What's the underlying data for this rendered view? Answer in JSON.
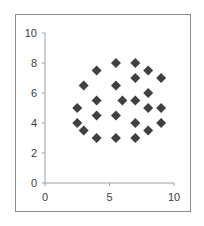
{
  "chart_data": {
    "type": "scatter",
    "title": "",
    "xlabel": "",
    "ylabel": "",
    "xlim": [
      0,
      10
    ],
    "ylim": [
      0,
      10
    ],
    "x_ticks": [
      0,
      5,
      10
    ],
    "y_ticks": [
      0,
      2,
      4,
      6,
      8,
      10
    ],
    "grid": false,
    "legend": null,
    "marker": "diamond",
    "marker_color": "#404040",
    "series": [
      {
        "name": "Series1",
        "points": [
          [
            5.5,
            8
          ],
          [
            7,
            8
          ],
          [
            4,
            7.5
          ],
          [
            8,
            7.5
          ],
          [
            7,
            7
          ],
          [
            9,
            7
          ],
          [
            3,
            6.5
          ],
          [
            5.5,
            6.5
          ],
          [
            8,
            6
          ],
          [
            4,
            5.5
          ],
          [
            6,
            5.5
          ],
          [
            7,
            5.5
          ],
          [
            2.5,
            5
          ],
          [
            8,
            5
          ],
          [
            9,
            5
          ],
          [
            4,
            4.5
          ],
          [
            5.5,
            4.5
          ],
          [
            2.5,
            4
          ],
          [
            7,
            4
          ],
          [
            9,
            4
          ],
          [
            3,
            3.5
          ],
          [
            8,
            3.5
          ],
          [
            4,
            3
          ],
          [
            5.5,
            3
          ],
          [
            7,
            3
          ]
        ]
      }
    ]
  },
  "colors": {
    "axis": "#a0a0a0",
    "frame": "#8a8a8a",
    "marker": "#404040",
    "label": "#404040"
  }
}
